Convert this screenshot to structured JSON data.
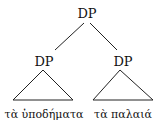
{
  "tree": {
    "root": {
      "label": "DP"
    },
    "left": {
      "label": "DP",
      "leaf": "τὰ ὑποδήματα"
    },
    "right": {
      "label": "DP",
      "leaf": "τὰ παλαιά"
    }
  }
}
